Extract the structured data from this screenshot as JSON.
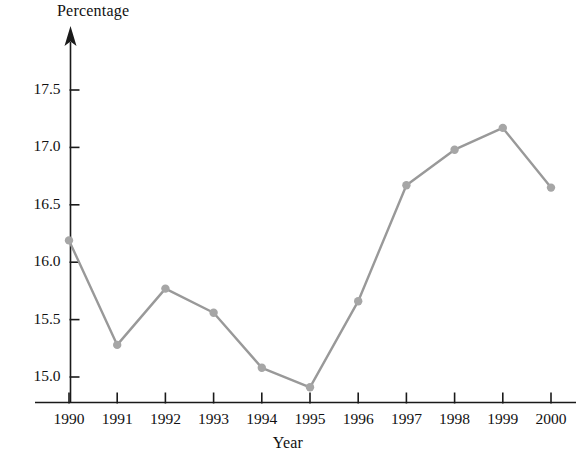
{
  "chart_data": {
    "type": "line",
    "title": "",
    "xlabel": "Year",
    "ylabel": "Percentage",
    "categories": [
      "1990",
      "1991",
      "1992",
      "1993",
      "1994",
      "1995",
      "1996",
      "1997",
      "1998",
      "1999",
      "2000"
    ],
    "values": [
      16.19,
      15.28,
      15.77,
      15.56,
      15.08,
      14.91,
      15.66,
      16.67,
      16.98,
      17.17,
      16.65
    ],
    "series": [
      {
        "name": "Percentage",
        "values": [
          16.19,
          15.28,
          15.77,
          15.56,
          15.08,
          14.91,
          15.66,
          16.67,
          16.98,
          17.17,
          16.65
        ]
      }
    ],
    "x": [
      1990,
      1991,
      1992,
      1993,
      1994,
      1995,
      1996,
      1997,
      1998,
      1999,
      2000
    ],
    "ylim": [
      14.78,
      17.72
    ],
    "xlim": [
      1989.6,
      2000.4
    ],
    "yticks": [
      "15.0",
      "15.5",
      "16.0",
      "16.5",
      "17.0",
      "17.5"
    ],
    "ytick_values": [
      15.0,
      15.5,
      16.0,
      16.5,
      17.0,
      17.5
    ],
    "xticks": [
      "1990",
      "1991",
      "1992",
      "1993",
      "1994",
      "1995",
      "1996",
      "1997",
      "1998",
      "1999",
      "2000"
    ],
    "grid": false,
    "legend": "none",
    "marker": "circle",
    "line_color": "#999999",
    "marker_color": "#a6a6a6",
    "axis_color": "#1a1a1a",
    "background": "#ffffff",
    "y_axis_arrow": true
  },
  "labels": {
    "y_axis_title": "Percentage",
    "x_axis_title": "Year"
  }
}
